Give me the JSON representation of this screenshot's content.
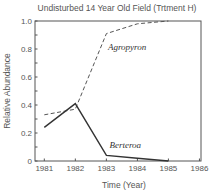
{
  "chart_data": {
    "type": "line",
    "title": "Undisturbed 14 Year Old Field (Trtment H)",
    "xlabel": "Time  (Year)",
    "ylabel": "Relative Abundance",
    "x": [
      1981,
      1982,
      1983,
      1984,
      1985
    ],
    "xlim": [
      1980.7,
      1986.05
    ],
    "ylim": [
      0,
      1.0
    ],
    "xticks": [
      "1981",
      "1982",
      "1983",
      "1984",
      "1985",
      "1986"
    ],
    "xtick_values": [
      1981,
      1982,
      1983,
      1984,
      1985,
      1986
    ],
    "yticks": [
      "0",
      "0.2",
      "0.4",
      "0.6",
      "0.8",
      "1.0"
    ],
    "ytick_values": [
      0,
      0.2,
      0.4,
      0.6,
      0.8,
      1.0
    ],
    "y_minor_step": 0.1,
    "grid": false,
    "series": [
      {
        "name": "Agropyron",
        "style": "dashed",
        "x": [
          1981,
          1982,
          1983,
          1984,
          1985
        ],
        "values": [
          0.33,
          0.37,
          0.91,
          0.98,
          1.0
        ],
        "label_at": [
          1983.05,
          0.79
        ]
      },
      {
        "name": "Berteroa",
        "style": "solid",
        "x": [
          1981,
          1982,
          1983,
          1984,
          1985
        ],
        "values": [
          0.24,
          0.41,
          0.04,
          0.02,
          0.0
        ],
        "label_at": [
          1983.1,
          0.09
        ]
      }
    ]
  }
}
